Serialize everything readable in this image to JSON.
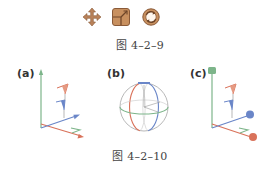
{
  "figure_9": {
    "icons": [
      {
        "name": "move-icon",
        "description": "four-way arrow"
      },
      {
        "name": "scale-icon",
        "description": "square with resize corner"
      },
      {
        "name": "rotate-icon",
        "description": "circular arrows"
      }
    ],
    "caption": "图 4–2–9",
    "icon_color": "#b9825a"
  },
  "figure_10": {
    "panels": [
      {
        "label": "(a)",
        "type": "translate-gizmo"
      },
      {
        "label": "(b)",
        "type": "rotate-gizmo"
      },
      {
        "label": "(c)",
        "type": "scale-gizmo"
      }
    ],
    "caption": "图 4–2–10",
    "axis_colors": {
      "x": "#d9725a",
      "y": "#6fae7a",
      "z": "#6a86c8"
    }
  }
}
